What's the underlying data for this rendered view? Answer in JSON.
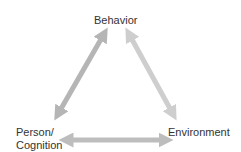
{
  "diagram": {
    "nodes": {
      "top": "Behavior",
      "left_line1": "Person/",
      "left_line2": "Cognition",
      "right": "Environment"
    },
    "colors": {
      "arrow_left": "#b5b5b5",
      "arrow_right": "#cecece",
      "arrow_bottom": "#bdbdbd",
      "text": "#333333"
    }
  }
}
